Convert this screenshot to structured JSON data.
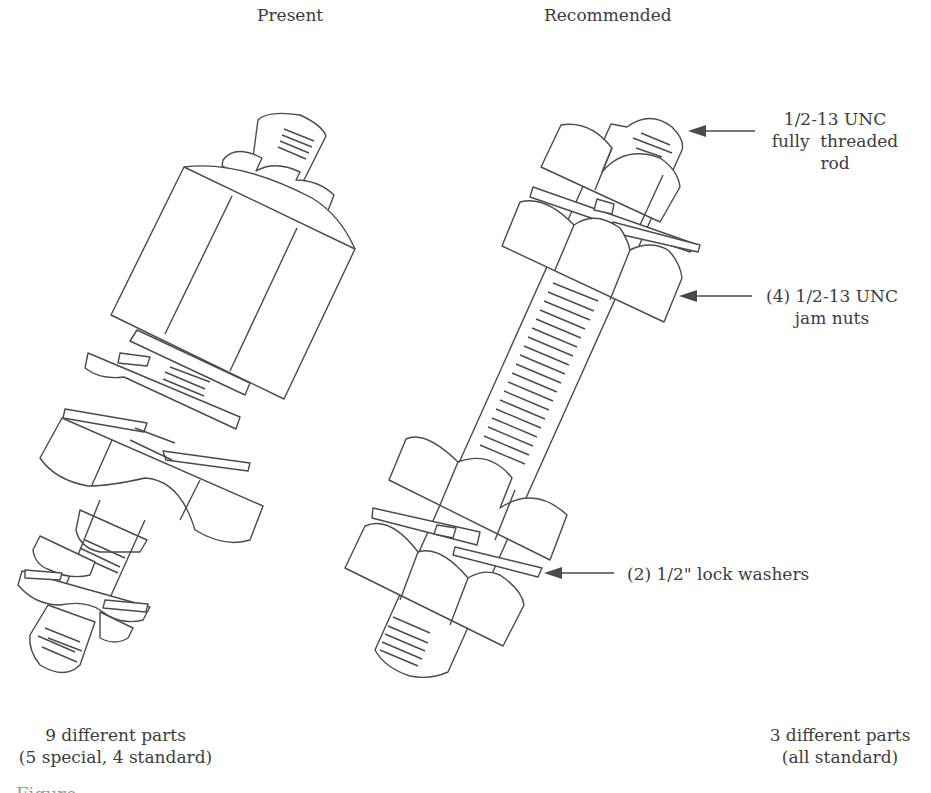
{
  "figure": {
    "columns": {
      "present": {
        "heading": "Present",
        "summary_line1": "9 different parts",
        "summary_line2": "(5 special, 4 standard)"
      },
      "recommended": {
        "heading": "Recommended",
        "summary_line1": "3 different parts",
        "summary_line2": "(all standard)"
      }
    },
    "callouts": [
      {
        "id": "rod",
        "lines": [
          "1/2-13 UNC",
          "fully  threaded",
          "rod"
        ]
      },
      {
        "id": "jam-nuts",
        "lines": [
          "(4) 1/2-13 UNC",
          "jam nuts"
        ]
      },
      {
        "id": "lock-washers",
        "lines": [
          "(2) 1/2\" lock washers"
        ]
      }
    ],
    "caption_partial": "Figure"
  },
  "colors": {
    "line": "#4a4a4a",
    "text": "#3c3c3c",
    "background": "#ffffff"
  }
}
